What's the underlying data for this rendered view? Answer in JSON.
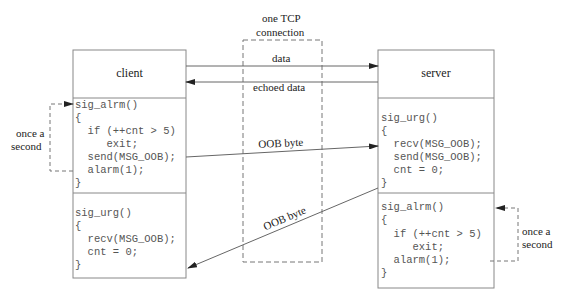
{
  "diagram": {
    "type": "client-server OOB heartbeat diagram",
    "connection_label_line1": "one TCP",
    "connection_label_line2": "connection",
    "client": {
      "title": "client",
      "sections": [
        {
          "name": "sig_alrm",
          "lines": [
            "sig_alrm()",
            "{",
            "  if (++cnt > 5)",
            "     exit;",
            "  send(MSG_OOB);",
            "  alarm(1);",
            "}"
          ]
        },
        {
          "name": "sig_urg",
          "lines": [
            "sig_urg()",
            "{",
            "  recv(MSG_OOB);",
            "  cnt = 0;",
            "}"
          ]
        }
      ],
      "timer_label_line1": "once a",
      "timer_label_line2": "second"
    },
    "server": {
      "title": "server",
      "sections": [
        {
          "name": "sig_urg",
          "lines": [
            "sig_urg()",
            "{",
            "  recv(MSG_OOB);",
            "  send(MSG_OOB);",
            "  cnt = 0;",
            "}"
          ]
        },
        {
          "name": "sig_alrm",
          "lines": [
            "sig_alrm()",
            "{",
            "  if (++cnt > 5)",
            "     exit;",
            "  alarm(1);",
            "}"
          ]
        }
      ],
      "timer_label_line1": "once a",
      "timer_label_line2": "second"
    },
    "arrows": {
      "data": "data",
      "echoed_data": "echoed data",
      "oob_to_server": "OOB byte",
      "oob_to_client": "OOB byte"
    },
    "colors": {
      "line": "#555555",
      "box": "#888888",
      "dashed": "#777777",
      "text": "#222222",
      "code": "#555555"
    }
  }
}
